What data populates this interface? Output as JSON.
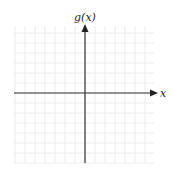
{
  "diagram": {
    "type": "coordinate-axes",
    "y_axis_label": "g(x)",
    "x_axis_label": "x",
    "grid": {
      "x_min_px": 14,
      "x_max_px": 154,
      "y_min_px": 26,
      "y_max_px": 163,
      "spacing_px": 10,
      "color": "#ececec"
    },
    "axes": {
      "origin_x_px": 85,
      "origin_y_px": 93,
      "color": "#333333"
    }
  }
}
